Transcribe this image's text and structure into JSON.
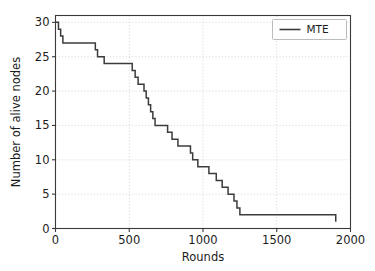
{
  "chart_data": {
    "type": "line",
    "title": "",
    "xlabel": "Rounds",
    "ylabel": "Number of alive nodes",
    "xlim": [
      0,
      2000
    ],
    "ylim": [
      0,
      31
    ],
    "xticks": [
      0,
      500,
      1000,
      1500,
      2000
    ],
    "yticks": [
      0,
      5,
      10,
      15,
      20,
      25,
      30
    ],
    "xtick_labels": [
      "0",
      "500",
      "1000",
      "1500",
      "2000"
    ],
    "ytick_labels": [
      "0",
      "5",
      "10",
      "15",
      "20",
      "25",
      "30"
    ],
    "grid": true,
    "legend_position": "upper right",
    "drawstyle": "steps-post",
    "series": [
      {
        "name": "MTE",
        "color": "#3c3c3c",
        "x": [
          0,
          20,
          35,
          50,
          65,
          270,
          285,
          300,
          330,
          420,
          505,
          520,
          540,
          560,
          580,
          600,
          615,
          630,
          645,
          660,
          675,
          690,
          700,
          760,
          790,
          830,
          900,
          915,
          930,
          950,
          965,
          1000,
          1040,
          1060,
          1090,
          1110,
          1130,
          1150,
          1170,
          1190,
          1210,
          1230,
          1250,
          1740,
          1900
        ],
        "y": [
          30,
          29,
          28,
          27,
          27,
          26,
          25,
          25,
          24,
          24,
          24,
          23,
          22,
          21,
          21,
          20,
          19,
          18,
          17,
          16,
          15,
          15,
          15,
          14,
          13,
          12,
          12,
          11,
          10,
          10,
          9,
          9,
          8,
          8,
          7,
          7,
          6,
          6,
          5,
          5,
          4,
          3,
          2,
          2,
          1
        ]
      }
    ]
  },
  "legend": {
    "entries": [
      {
        "label": "MTE"
      }
    ]
  }
}
